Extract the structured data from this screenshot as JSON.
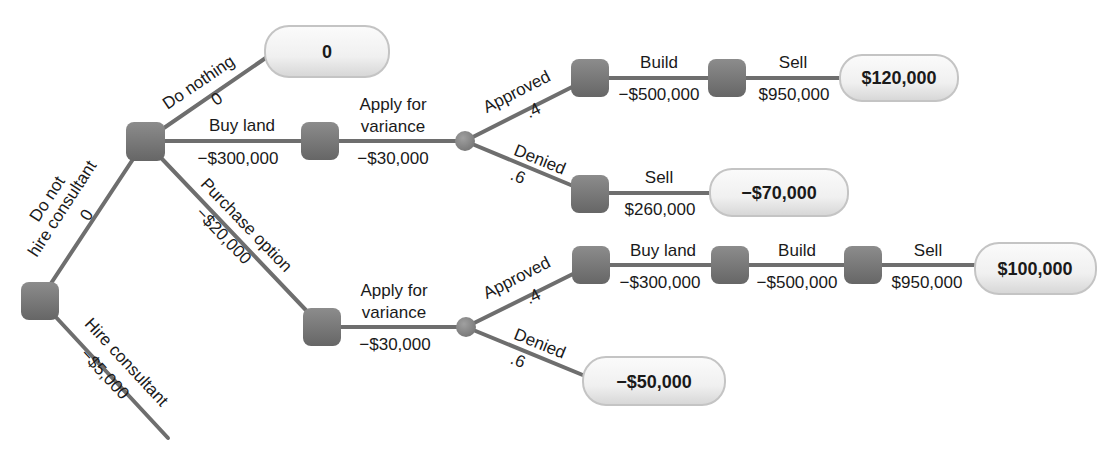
{
  "diagram": {
    "type": "decision-tree",
    "colors": {
      "edge": "#6e6e6e",
      "decision_node": "#7a7a7a",
      "chance_node": "#8a8a8a",
      "terminal_fill": "#f2f2f2",
      "terminal_border": "#c8c8c8",
      "text": "#1a1a1a"
    },
    "root_branches": {
      "do_not_hire": {
        "label_line1": "Do not",
        "label_line2": "hire consultant",
        "value": "0"
      },
      "hire": {
        "label": "Hire consultant",
        "value": "−$5,000"
      }
    },
    "decision_1_branches": {
      "do_nothing": {
        "label": "Do nothing",
        "value": "0"
      },
      "buy_land": {
        "label": "Buy land",
        "value": "−$300,000"
      },
      "purchase_option": {
        "label": "Purchase option",
        "value": "−$20,000"
      }
    },
    "upper_path": {
      "apply": {
        "label_line1": "Apply for",
        "label_line2": "variance",
        "value": "−$30,000"
      },
      "approved": {
        "label": "Approved",
        "prob": ".4"
      },
      "denied": {
        "label": "Denied",
        "prob": ".6"
      },
      "build": {
        "label": "Build",
        "value": "−$500,000"
      },
      "sell_approved": {
        "label": "Sell",
        "value": "$950,000"
      },
      "sell_denied": {
        "label": "Sell",
        "value": "$260,000"
      }
    },
    "lower_path": {
      "apply": {
        "label_line1": "Apply for",
        "label_line2": "variance",
        "value": "−$30,000"
      },
      "approved": {
        "label": "Approved",
        "prob": ".4"
      },
      "denied": {
        "label": "Denied",
        "prob": ".6"
      },
      "buy_land": {
        "label": "Buy land",
        "value": "−$300,000"
      },
      "build": {
        "label": "Build",
        "value": "−$500,000"
      },
      "sell": {
        "label": "Sell",
        "value": "$950,000"
      }
    },
    "terminals": {
      "do_nothing": "0",
      "upper_approved": "$120,000",
      "upper_denied": "−$70,000",
      "lower_approved": "$100,000",
      "lower_denied": "−$50,000"
    }
  }
}
